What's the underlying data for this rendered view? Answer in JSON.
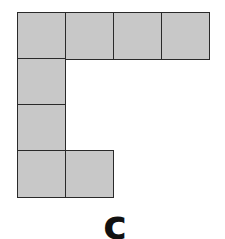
{
  "figure": {
    "label": "c",
    "cell_color": "#c8c8c8",
    "border_color": "#2a2a2a",
    "cells": [
      {
        "row": 0,
        "col": 0
      },
      {
        "row": 0,
        "col": 1
      },
      {
        "row": 0,
        "col": 2
      },
      {
        "row": 0,
        "col": 3
      },
      {
        "row": 1,
        "col": 0
      },
      {
        "row": 2,
        "col": 0
      },
      {
        "row": 3,
        "col": 0
      },
      {
        "row": 3,
        "col": 1
      }
    ]
  }
}
